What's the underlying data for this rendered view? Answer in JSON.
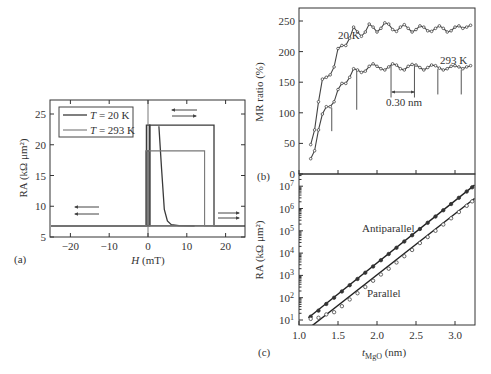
{
  "chart_data": [
    {
      "id": "a",
      "type": "line",
      "panel_label": "(a)",
      "title": "",
      "xlabel": "H (mT)",
      "ylabel": "RA (kΩ μm²)",
      "xlim": [
        -25,
        25
      ],
      "ylim": [
        5,
        27
      ],
      "xticks": [
        -20,
        -10,
        0,
        10,
        20
      ],
      "yticks": [
        5,
        10,
        15,
        20,
        25
      ],
      "legend": {
        "position": "upper left",
        "entries": [
          "T = 20 K",
          "T = 293 K"
        ]
      },
      "annotations": [
        {
          "type": "arrows",
          "text": "sweep direction ← ←",
          "x": -16,
          "y": [
            9.8,
            8.8
          ],
          "direction": "left"
        },
        {
          "type": "arrows",
          "text": "sweep direction ← →",
          "x": 4,
          "y": [
            25.6,
            24.8
          ],
          "direction": "both"
        },
        {
          "type": "arrows",
          "text": "sweep direction → →",
          "x": 21,
          "y": [
            8.8,
            8.0
          ],
          "direction": "right"
        }
      ],
      "series": [
        {
          "name": "T = 20 K",
          "branches": [
            {
              "label": "forward sweep",
              "x": [
                -25,
                0.4,
                0.4,
                17,
                17,
                25
              ],
              "y": [
                6.8,
                6.8,
                23.2,
                23.2,
                6.8,
                6.8
              ]
            },
            {
              "label": "reverse sweep",
              "x": [
                25,
                0.5,
                0.5,
                -0.4,
                -0.4,
                -25
              ],
              "y": [
                6.8,
                6.8,
                23.2,
                23.2,
                6.8,
                6.8
              ]
            },
            {
              "label": "minor decay",
              "x": [
                2.8,
                3.5,
                4.2,
                5.0,
                6.0,
                8.0,
                12
              ],
              "y": [
                23.0,
                16.0,
                9.5,
                7.6,
                7.0,
                6.85,
                6.8
              ]
            }
          ]
        },
        {
          "name": "T = 293 K",
          "branches": [
            {
              "label": "forward sweep",
              "x": [
                -25,
                -0.2,
                -0.2,
                14.6,
                14.6,
                25
              ],
              "y": [
                6.8,
                6.8,
                19.0,
                19.0,
                6.8,
                6.8
              ]
            },
            {
              "label": "reverse sweep",
              "x": [
                25,
                0.2,
                0.2,
                -0.6,
                -0.6,
                -25
              ],
              "y": [
                6.8,
                6.8,
                19.0,
                19.0,
                6.8,
                6.8
              ]
            }
          ]
        }
      ]
    },
    {
      "id": "b",
      "type": "line",
      "panel_label": "(b)",
      "title": "",
      "xlabel": "",
      "ylabel": "MR ratio (%)",
      "xlim": [
        1.0,
        3.25
      ],
      "ylim": [
        0,
        270
      ],
      "xticks": [
        1.0,
        1.5,
        2.0,
        2.5,
        3.0
      ],
      "yticks": [
        0,
        50,
        100,
        150,
        200,
        250
      ],
      "annotations": [
        {
          "type": "text",
          "text": "20 K",
          "x": 1.55,
          "y": 220
        },
        {
          "type": "text",
          "text": "293 K",
          "x": 2.95,
          "y": 195
        },
        {
          "type": "period",
          "text": "0.30 nm",
          "x_from": 2.18,
          "x_to": 2.48,
          "y": 115
        },
        {
          "type": "oscillation-markers",
          "x": [
            1.42,
            1.74,
            2.18,
            2.48,
            2.78,
            3.08
          ],
          "y_bottom": [
            70,
            105,
            125,
            125,
            130,
            130
          ]
        }
      ],
      "series": [
        {
          "name": "20 K",
          "x": [
            1.15,
            1.2,
            1.25,
            1.3,
            1.35,
            1.4,
            1.45,
            1.5,
            1.55,
            1.6,
            1.65,
            1.7,
            1.75,
            1.8,
            1.85,
            1.9,
            1.95,
            2.0,
            2.05,
            2.1,
            2.15,
            2.2,
            2.25,
            2.3,
            2.35,
            2.4,
            2.45,
            2.5,
            2.55,
            2.6,
            2.65,
            2.7,
            2.75,
            2.8,
            2.85,
            2.9,
            2.95,
            3.0,
            3.05,
            3.1,
            3.15,
            3.2
          ],
          "y": [
            48,
            72,
            118,
            155,
            158,
            162,
            175,
            205,
            210,
            210,
            222,
            240,
            232,
            225,
            232,
            245,
            240,
            232,
            238,
            247,
            245,
            236,
            233,
            240,
            244,
            238,
            232,
            236,
            242,
            240,
            234,
            233,
            238,
            242,
            238,
            232,
            234,
            240,
            242,
            238,
            240,
            243
          ]
        },
        {
          "name": "293 K",
          "x": [
            1.15,
            1.2,
            1.25,
            1.3,
            1.35,
            1.4,
            1.45,
            1.5,
            1.55,
            1.6,
            1.65,
            1.7,
            1.75,
            1.8,
            1.85,
            1.9,
            1.95,
            2.0,
            2.05,
            2.1,
            2.15,
            2.2,
            2.25,
            2.3,
            2.35,
            2.4,
            2.45,
            2.5,
            2.55,
            2.6,
            2.65,
            2.7,
            2.75,
            2.8,
            2.85,
            2.9,
            2.95,
            3.0,
            3.05,
            3.1,
            3.15,
            3.2
          ],
          "y": [
            25,
            38,
            72,
            98,
            110,
            110,
            118,
            138,
            148,
            148,
            158,
            172,
            170,
            166,
            168,
            176,
            180,
            176,
            172,
            170,
            175,
            180,
            178,
            172,
            170,
            176,
            179,
            178,
            174,
            170,
            174,
            178,
            177,
            173,
            170,
            172,
            176,
            177,
            175,
            172,
            175,
            177
          ]
        }
      ]
    },
    {
      "id": "c",
      "type": "scatter",
      "panel_label": "(c)",
      "title": "",
      "xlabel": "t_MgO (nm)",
      "ylabel": "RA (kΩ μm²)",
      "yscale": "log",
      "xlim": [
        1.0,
        3.25
      ],
      "ylim": [
        5,
        20000000
      ],
      "xticks": [
        1.0,
        1.5,
        2.0,
        2.5,
        3.0
      ],
      "yticks": [
        "10^1",
        "10^2",
        "10^3",
        "10^4",
        "10^5",
        "10^6",
        "10^7"
      ],
      "annotations": [
        {
          "type": "text",
          "text": "Antiparallel",
          "x": 2.2,
          "y": 100000
        },
        {
          "type": "text",
          "text": "Parallel",
          "x": 2.0,
          "y": 100
        }
      ],
      "series": [
        {
          "name": "Antiparallel",
          "marker": "filled circle",
          "fit": {
            "x": [
              1.12,
              3.25
            ],
            "log10y": [
              1.1,
              7.05
            ]
          },
          "x": [
            1.15,
            1.25,
            1.35,
            1.45,
            1.55,
            1.65,
            1.75,
            1.85,
            1.95,
            2.05,
            2.15,
            2.25,
            2.35,
            2.45,
            2.55,
            2.65,
            2.75,
            2.85,
            2.95,
            3.05,
            3.15,
            3.22
          ],
          "log10y": [
            1.15,
            1.42,
            1.72,
            2.0,
            2.28,
            2.56,
            2.84,
            3.12,
            3.4,
            3.68,
            3.96,
            4.24,
            4.52,
            4.8,
            5.08,
            5.36,
            5.64,
            5.92,
            6.2,
            6.48,
            6.76,
            6.95
          ]
        },
        {
          "name": "Parallel",
          "marker": "open circle",
          "fit": {
            "x": [
              1.17,
              3.25
            ],
            "log10y": [
              0.75,
              6.45
            ]
          },
          "x": [
            1.15,
            1.25,
            1.35,
            1.45,
            1.55,
            1.65,
            1.75,
            1.85,
            1.95,
            2.05,
            2.15,
            2.25,
            2.35,
            2.45,
            2.55,
            2.65,
            2.75,
            2.85,
            2.95,
            3.05,
            3.15,
            3.22
          ],
          "log10y": [
            1.05,
            1.1,
            1.25,
            1.35,
            1.62,
            1.92,
            2.2,
            2.48,
            2.76,
            3.04,
            3.3,
            3.58,
            3.86,
            4.14,
            4.45,
            4.72,
            5.0,
            5.28,
            5.56,
            5.84,
            6.12,
            6.32
          ]
        }
      ]
    }
  ],
  "labels": {
    "a": {
      "panel": "(a)",
      "xlabel_italic": "H",
      "xlabel_unit": " (mT)",
      "ylabel": "RA (kΩ μm²)",
      "legend": [
        {
          "italic": "T",
          "text": " = 20 K"
        },
        {
          "italic": "T",
          "text": " = 293 K"
        }
      ]
    },
    "b": {
      "panel": "(b)",
      "ylabel": "MR ratio (%)",
      "t20": "20 K",
      "t293": "293 K",
      "period": "0.30 nm"
    },
    "c": {
      "panel": "(c)",
      "ylabel": "RA (kΩ μm²)",
      "xlabel_italic": "t",
      "xlabel_sub": "MgO",
      "xlabel_unit": " (nm)",
      "ap": "Antiparallel",
      "p": "Parallel"
    }
  }
}
